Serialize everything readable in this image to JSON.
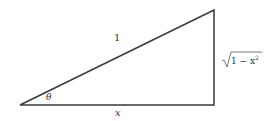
{
  "diagram": {
    "type": "right-triangle",
    "vertices": {
      "left": [
        20,
        105
      ],
      "bottom_right": [
        214,
        105
      ],
      "top_right": [
        214,
        10
      ]
    },
    "stroke_color": "#3a3a3a",
    "labels": {
      "hypotenuse": "1",
      "angle": "θ",
      "base": "x",
      "height_radicand": "1 − x",
      "height_exponent": "2"
    }
  }
}
